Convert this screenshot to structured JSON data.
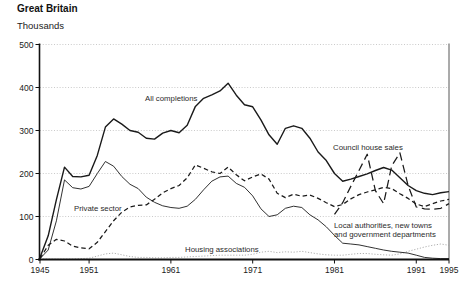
{
  "header": {
    "title": "Great Britain",
    "subtitle": "Thousands"
  },
  "chart_data": {
    "type": "line",
    "title": "Great Britain",
    "units_label": "Thousands",
    "x": [
      1945,
      1946,
      1947,
      1948,
      1949,
      1950,
      1951,
      1952,
      1953,
      1954,
      1955,
      1956,
      1957,
      1958,
      1959,
      1960,
      1961,
      1962,
      1963,
      1964,
      1965,
      1966,
      1967,
      1968,
      1969,
      1970,
      1971,
      1972,
      1973,
      1974,
      1975,
      1976,
      1977,
      1978,
      1979,
      1980,
      1981,
      1982,
      1983,
      1984,
      1985,
      1986,
      1987,
      1988,
      1989,
      1990,
      1991,
      1992,
      1993,
      1994,
      1995
    ],
    "series": [
      {
        "id": "all-completions",
        "name": "All completions",
        "style": "solid",
        "color": "#1a1a1a",
        "width": 1.4,
        "values": [
          5,
          55,
          139,
          215,
          193,
          192,
          196,
          242,
          308,
          327,
          315,
          300,
          296,
          282,
          280,
          294,
          300,
          295,
          312,
          356,
          375,
          383,
          392,
          410,
          382,
          360,
          355,
          325,
          290,
          268,
          305,
          311,
          305,
          282,
          250,
          230,
          200,
          182,
          187,
          193,
          199,
          207,
          214,
          208,
          190,
          172,
          160,
          154,
          151,
          155,
          158
        ]
      },
      {
        "id": "local-authorities",
        "name": "Local authorities, new towns and government departments",
        "style": "solid",
        "color": "#1a1a1a",
        "width": 0.9,
        "values": [
          2,
          22,
          90,
          185,
          167,
          164,
          170,
          200,
          228,
          217,
          193,
          175,
          165,
          145,
          133,
          125,
          121,
          119,
          124,
          140,
          162,
          182,
          192,
          194,
          177,
          168,
          148,
          118,
          100,
          104,
          119,
          124,
          121,
          104,
          92,
          76,
          56,
          38,
          36,
          34,
          30,
          26,
          22,
          19,
          17,
          15,
          10,
          5,
          3,
          2,
          2
        ]
      },
      {
        "id": "private-sector",
        "name": "Private sector",
        "style": "dash",
        "color": "#1a1a1a",
        "width": 1.25,
        "values": [
          2,
          33,
          47,
          43,
          31,
          27,
          25,
          40,
          65,
          90,
          110,
          122,
          126,
          127,
          140,
          155,
          165,
          172,
          190,
          220,
          212,
          204,
          200,
          215,
          197,
          183,
          192,
          199,
          187,
          154,
          144,
          152,
          147,
          150,
          142,
          132,
          123,
          128,
          141,
          151,
          157,
          162,
          168,
          165,
          153,
          142,
          129,
          123,
          130,
          136,
          140
        ]
      },
      {
        "id": "council-house-sales",
        "name": "Council house sales",
        "style": "longdash",
        "color": "#1a1a1a",
        "width": 1.25,
        "values": [
          null,
          null,
          null,
          null,
          null,
          null,
          null,
          null,
          null,
          null,
          null,
          null,
          null,
          null,
          null,
          null,
          null,
          null,
          null,
          null,
          null,
          null,
          null,
          null,
          null,
          null,
          null,
          null,
          null,
          null,
          null,
          null,
          null,
          null,
          null,
          null,
          105,
          132,
          170,
          207,
          245,
          160,
          130,
          218,
          248,
          172,
          122,
          118,
          117,
          119,
          130
        ]
      },
      {
        "id": "housing-associations",
        "name": "Housing associations",
        "style": "dotted",
        "color": "#9a9a9a",
        "width": 0.8,
        "values": [
          1,
          1,
          1,
          1,
          1,
          2,
          3,
          8,
          13,
          15,
          11,
          7,
          5,
          5,
          4,
          4,
          5,
          5,
          6,
          7,
          8,
          9,
          10,
          10,
          10,
          10,
          12,
          17,
          19,
          16,
          18,
          17,
          19,
          16,
          13,
          11,
          10,
          10,
          12,
          14,
          14,
          12,
          11,
          10,
          13,
          19,
          24,
          29,
          33,
          36,
          33
        ]
      }
    ],
    "annotations": [
      {
        "id": "all-completions-label",
        "lines": [
          "All completions"
        ],
        "x": 145,
        "y": 101
      },
      {
        "id": "private-sector-label",
        "lines": [
          "Private sector"
        ],
        "x": 74,
        "y": 211
      },
      {
        "id": "housing-associations-label",
        "lines": [
          "Housing associations"
        ],
        "x": 185,
        "y": 252
      },
      {
        "id": "council-house-sales-label",
        "lines": [
          "Council house sales"
        ],
        "x": 333,
        "y": 150
      },
      {
        "id": "local-authorities-label",
        "lines": [
          "Local authorities, new towns",
          "and government departments"
        ],
        "x": 334,
        "y": 228,
        "line_height": 9
      }
    ],
    "y_axis": {
      "ticks": [
        0,
        100,
        200,
        300,
        400,
        500
      ],
      "max": 500
    },
    "x_axis": {
      "ticks": [
        1945,
        1951,
        1961,
        1971,
        1981,
        1991,
        1995
      ],
      "min": 1945,
      "max": 1995
    },
    "grid": {
      "color": "#b3b3b3",
      "dash": "1,1.8"
    },
    "axis_color": "#111111",
    "border_color": "#444444",
    "background": "#ffffff",
    "dash_patterns": {
      "solid": "",
      "dash": "4.5,3",
      "longdash": "8,4.5",
      "dotted": "1.2,1.7"
    },
    "draw_order": [
      "housing-associations",
      "local-authorities",
      "private-sector",
      "council-house-sales",
      "all-completions"
    ],
    "legend_position": "inline-annotations",
    "grid_on": true
  }
}
